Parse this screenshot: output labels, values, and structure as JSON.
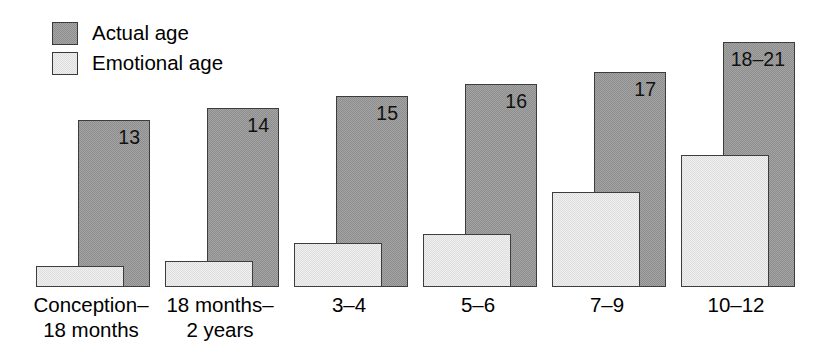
{
  "legend": {
    "position": "top-left",
    "items": [
      {
        "key": "actual",
        "label": "Actual age",
        "color": "#8d8d8d"
      },
      {
        "key": "emotional",
        "label": "Emotional age",
        "color": "#dedede"
      }
    ]
  },
  "chart_data": {
    "type": "bar",
    "title": "",
    "subtitle": "",
    "xlabel": "",
    "ylabel": "",
    "grid": false,
    "legend_position": "top-left",
    "categories": [
      "Conception–18 months",
      "18 months–2 years",
      "3–4",
      "5–6",
      "7–9",
      "10–12"
    ],
    "category_lines": [
      [
        "Conception–",
        "18 months"
      ],
      [
        "18 months–",
        "2 years"
      ],
      [
        "3–4",
        ""
      ],
      [
        "5–6",
        ""
      ],
      [
        "7–9",
        ""
      ],
      [
        "10–12",
        ""
      ]
    ],
    "series": [
      {
        "name": "Actual age",
        "color": "#8d8d8d",
        "values": [
          13,
          14,
          15,
          16,
          17,
          21
        ],
        "labels": [
          "13",
          "14",
          "15",
          "16",
          "17",
          "18–21"
        ]
      },
      {
        "name": "Emotional age",
        "color": "#dedede",
        "values": [
          0.75,
          1,
          2,
          2.5,
          4.5,
          7.5
        ],
        "labels": [
          "",
          "",
          "",
          "",
          "",
          ""
        ]
      }
    ],
    "ylim": [
      0,
      22
    ]
  },
  "bars": [
    {
      "group": 0,
      "actual_label": "13",
      "actual_top_px": 120,
      "actual_left_px": 78,
      "actual_width_px": 72,
      "emotional_top_px": 266,
      "emotional_left_px": 36,
      "emotional_width_px": 88
    },
    {
      "group": 1,
      "actual_label": "14",
      "actual_top_px": 108,
      "actual_left_px": 207,
      "actual_width_px": 72,
      "emotional_top_px": 261,
      "emotional_left_px": 165,
      "emotional_width_px": 88
    },
    {
      "group": 2,
      "actual_label": "15",
      "actual_top_px": 96,
      "actual_left_px": 336,
      "actual_width_px": 72,
      "emotional_top_px": 243,
      "emotional_left_px": 294,
      "emotional_width_px": 88
    },
    {
      "group": 3,
      "actual_label": "16",
      "actual_top_px": 84,
      "actual_left_px": 465,
      "actual_width_px": 72,
      "emotional_top_px": 234,
      "emotional_left_px": 423,
      "emotional_width_px": 88
    },
    {
      "group": 4,
      "actual_label": "17",
      "actual_top_px": 72,
      "actual_left_px": 594,
      "actual_width_px": 72,
      "emotional_top_px": 192,
      "emotional_left_px": 552,
      "emotional_width_px": 88
    },
    {
      "group": 5,
      "actual_label": "18–21",
      "actual_top_px": 42,
      "actual_left_px": 723,
      "actual_width_px": 72,
      "emotional_top_px": 155,
      "emotional_left_px": 681,
      "emotional_width_px": 88
    }
  ],
  "axis": {
    "baseline_y_px": 287,
    "label_top_px": 292
  },
  "category_label_positions": [
    {
      "left_px": 16,
      "width_px": 150
    },
    {
      "left_px": 145,
      "width_px": 150
    },
    {
      "left_px": 274,
      "width_px": 150
    },
    {
      "left_px": 403,
      "width_px": 150
    },
    {
      "left_px": 532,
      "width_px": 150
    },
    {
      "left_px": 661,
      "width_px": 150
    }
  ]
}
